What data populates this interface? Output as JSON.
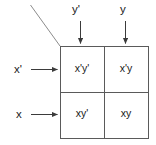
{
  "diagram": {
    "type": "karnaugh-map",
    "colors": {
      "stroke": "#555555",
      "text": "#1a1a1a",
      "background": "#ffffff"
    },
    "column_inputs": [
      {
        "label": "y'",
        "icon": "arrow-down-icon"
      },
      {
        "label": "y",
        "icon": "arrow-down-icon"
      }
    ],
    "row_inputs": [
      {
        "label": "x'",
        "icon": "arrow-right-icon"
      },
      {
        "label": "x",
        "icon": "arrow-right-icon"
      }
    ],
    "cells": [
      {
        "label": "x'y'",
        "row": "x'",
        "column": "y'"
      },
      {
        "label": "x'y",
        "row": "x'",
        "column": "y"
      },
      {
        "label": "xy'",
        "row": "x",
        "column": "y'"
      },
      {
        "label": "xy",
        "row": "x",
        "column": "y"
      }
    ],
    "leader_line": "corner-leader-line"
  }
}
